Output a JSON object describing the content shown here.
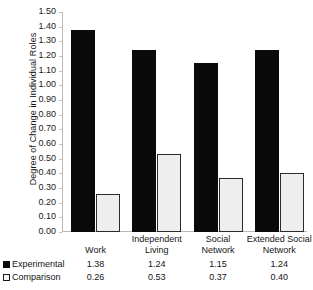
{
  "chart_data": {
    "type": "bar",
    "title": "",
    "xlabel": "",
    "ylabel": "Degree of Change in Individual Roles",
    "ylim": [
      0.0,
      1.5
    ],
    "ytick_step": 0.1,
    "grid": false,
    "legend_position": "bottom-table",
    "categories": [
      "Work",
      "Independent Living",
      "Social Network",
      "Extended Social Network"
    ],
    "category_lines": [
      [
        "Work"
      ],
      [
        "Independent",
        "Living"
      ],
      [
        "Social",
        "Network"
      ],
      [
        "Extended Social",
        "Network"
      ]
    ],
    "series": [
      {
        "name": "Experimental",
        "values": [
          1.38,
          1.24,
          1.15,
          1.24
        ],
        "value_labels": [
          "1.38",
          "1.24",
          "1.15",
          "1.24"
        ],
        "color": "#0a0a0a",
        "swatch": "filled"
      },
      {
        "name": "Comparison",
        "values": [
          0.26,
          0.53,
          0.37,
          0.4
        ],
        "value_labels": [
          "0.26",
          "0.53",
          "0.37",
          "0.40"
        ],
        "color": "#eeeeee",
        "border_color": "#2a2a2a",
        "swatch": "hollow"
      }
    ],
    "ytick_labels": [
      "0.00",
      "0.10",
      "0.20",
      "0.30",
      "0.40",
      "0.50",
      "0.60",
      "0.70",
      "0.80",
      "0.90",
      "1.00",
      "1.10",
      "1.20",
      "1.30",
      "1.40",
      "1.50"
    ],
    "ytick_values": [
      0.0,
      0.1,
      0.2,
      0.3,
      0.4,
      0.5,
      0.6,
      0.7,
      0.8,
      0.9,
      1.0,
      1.1,
      1.2,
      1.3,
      1.4,
      1.5
    ]
  }
}
